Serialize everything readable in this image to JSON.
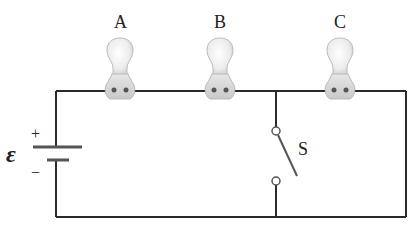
{
  "diagram": {
    "type": "circuit",
    "bulbs": [
      {
        "label": "A",
        "cx": 120
      },
      {
        "label": "B",
        "cx": 220
      },
      {
        "label": "C",
        "cx": 340
      }
    ],
    "battery": {
      "symbol": "ε",
      "plus": "+",
      "minus": "−"
    },
    "switch": {
      "label": "S",
      "state": "open"
    },
    "colors": {
      "wire": "#2a2a2a",
      "bulb_glass": "#eeeeee",
      "bulb_base": "#d9d9d9",
      "contact": "#555555"
    }
  }
}
